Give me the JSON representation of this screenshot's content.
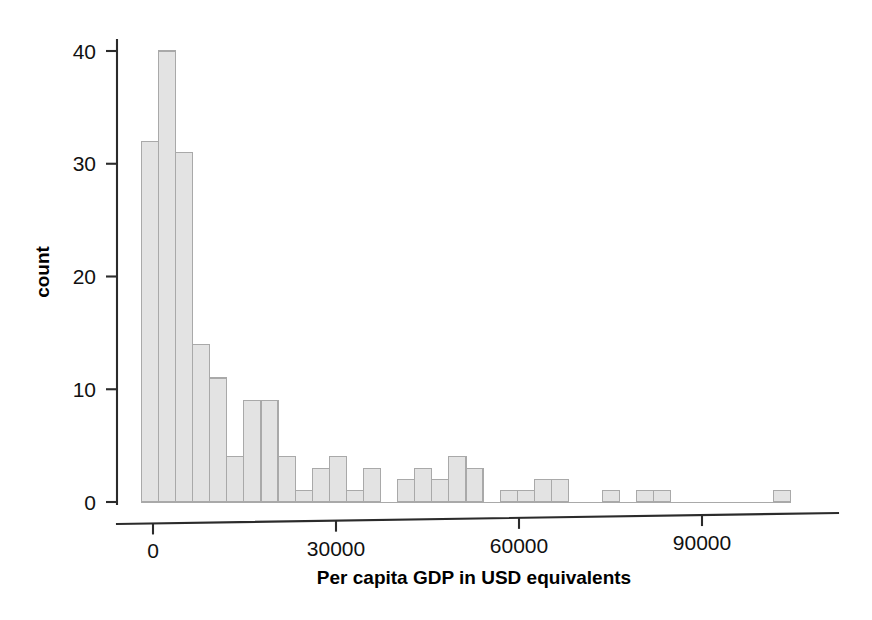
{
  "chart_data": {
    "type": "bar",
    "subtype": "histogram",
    "title": "",
    "xlabel": "Per capita GDP in USD equivalents",
    "ylabel": "count",
    "xlim": [
      -3000,
      108000
    ],
    "ylim": [
      0,
      42
    ],
    "grid": false,
    "legend": null,
    "bin_width": 2800,
    "x_ticks": [
      0,
      30000,
      60000,
      90000
    ],
    "x_tick_labels": [
      "0",
      "30000",
      "60000",
      "90000"
    ],
    "y_ticks": [
      0,
      10,
      20,
      30,
      40
    ],
    "y_tick_labels": [
      "0",
      "10",
      "20",
      "30",
      "40"
    ],
    "bin_starts": [
      -1900,
      900,
      3700,
      6500,
      9300,
      12100,
      14900,
      17700,
      20500,
      23300,
      26100,
      28900,
      31700,
      34500,
      37300,
      40100,
      42900,
      45700,
      48500,
      51300,
      54100,
      56900,
      59700,
      62500,
      65300,
      68100,
      70900,
      73700,
      76500,
      79300,
      82100,
      84900,
      87700,
      90500,
      93300,
      96100,
      98900,
      101700
    ],
    "bin_centers": [
      -500,
      2300,
      5100,
      7900,
      10700,
      13500,
      16300,
      19100,
      21900,
      24700,
      27500,
      30300,
      33100,
      35900,
      38700,
      41500,
      44300,
      47100,
      49900,
      52700,
      55500,
      58300,
      61100,
      63900,
      66700,
      69500,
      72300,
      75100,
      77900,
      80700,
      83500,
      86300,
      89100,
      91900,
      94700,
      97500,
      100300,
      103100
    ],
    "values": [
      32,
      40,
      31,
      14,
      11,
      4,
      9,
      9,
      4,
      1,
      3,
      4,
      1,
      3,
      0,
      2,
      3,
      2,
      4,
      3,
      0,
      1,
      1,
      2,
      2,
      0,
      0,
      1,
      0,
      1,
      1,
      0,
      0,
      0,
      0,
      0,
      0,
      1
    ],
    "bar_fill_color": "#e3e3e3",
    "bar_edge_color": "#a9a9a9",
    "axis_color": "#2b2b2b",
    "background_color": "#ffffff",
    "total_count": 189
  },
  "axes": {
    "x_axis_label": "Per capita GDP in USD equivalents",
    "y_axis_label": "count"
  }
}
